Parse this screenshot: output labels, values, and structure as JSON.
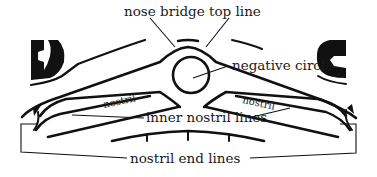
{
  "figure": {
    "colors": {
      "ink": "#111111",
      "background": "#ffffff",
      "text": "#1a1a1a"
    },
    "labels": {
      "nose_bridge_top_line": "nose bridge top line",
      "negative_circle": "negative circle",
      "inner_nostril_lines": "inner nostril lines",
      "nostril_end_lines": "nostril end lines",
      "nostril_left": "nostril",
      "nostril_right": "nostril"
    }
  }
}
